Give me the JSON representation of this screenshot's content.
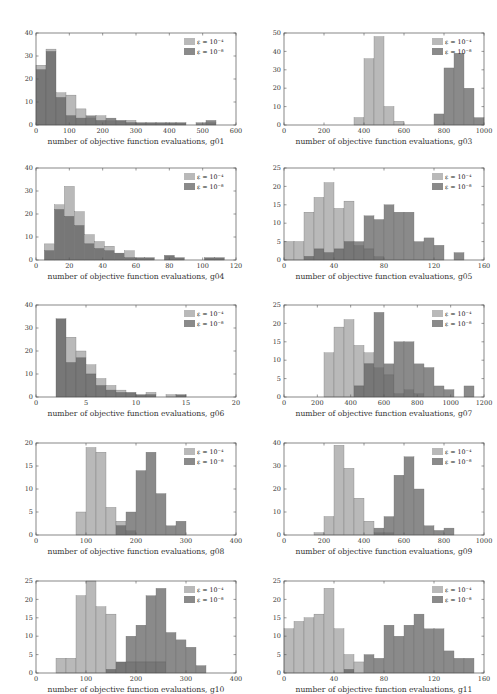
{
  "legend": {
    "light_label": "ε = 10⁻⁴",
    "dark_label": "ε = 10⁻⁸"
  },
  "colors": {
    "light": "#b9b9b9",
    "dark": "#8a8a8a",
    "overlap": "#777777",
    "axis": "#555555"
  },
  "chart_data": [
    {
      "id": "g01",
      "type": "bar",
      "xlabel": "number of objective function evaluations, g01",
      "xlim": [
        0,
        600
      ],
      "xticks": [
        0,
        100,
        200,
        300,
        400,
        500,
        600
      ],
      "ylim": [
        0,
        40
      ],
      "yticks": [
        0,
        10,
        20,
        30,
        40
      ],
      "bin_start": 0,
      "bin_width": 30,
      "series": [
        {
          "name": "ε = 10⁻⁴",
          "values": [
            26,
            33,
            14,
            13,
            7,
            3,
            4,
            2,
            2,
            2,
            1,
            1,
            1,
            1,
            1,
            0,
            0,
            1,
            0,
            0
          ]
        },
        {
          "name": "ε = 10⁻⁸",
          "values": [
            24,
            32,
            12,
            4,
            3,
            4,
            2,
            3,
            2,
            1,
            1,
            1,
            1,
            1,
            1,
            0,
            1,
            2,
            0,
            0
          ]
        }
      ]
    },
    {
      "id": "g03",
      "type": "bar",
      "xlabel": "number of objective function evaluations, g03",
      "xlim": [
        0,
        1000
      ],
      "xticks": [
        0,
        200,
        400,
        600,
        800,
        1000
      ],
      "ylim": [
        0,
        50
      ],
      "yticks": [
        0,
        10,
        20,
        30,
        40,
        50
      ],
      "bin_start": 350,
      "bin_width": 50,
      "series": [
        {
          "name": "ε = 10⁻⁴",
          "values": [
            4,
            36,
            48,
            10,
            2,
            0,
            0,
            0,
            0,
            0,
            0,
            0,
            0
          ]
        },
        {
          "name": "ε = 10⁻⁸",
          "values": [
            0,
            0,
            0,
            0,
            0,
            0,
            0,
            0,
            6,
            31,
            39,
            20,
            4
          ]
        }
      ]
    },
    {
      "id": "g04",
      "type": "bar",
      "xlabel": "number of objective function evaluations, g04",
      "xlim": [
        0,
        120
      ],
      "xticks": [
        0,
        20,
        40,
        60,
        80,
        100,
        120
      ],
      "ylim": [
        0,
        40
      ],
      "yticks": [
        0,
        10,
        20,
        30,
        40
      ],
      "bin_start": 5,
      "bin_width": 6,
      "series": [
        {
          "name": "ε = 10⁻⁴",
          "values": [
            7,
            24,
            32,
            21,
            11,
            8,
            6,
            3,
            4,
            1,
            1,
            0,
            2,
            1,
            0,
            0,
            1,
            1
          ]
        },
        {
          "name": "ε = 10⁻⁸",
          "values": [
            4,
            22,
            19,
            15,
            7,
            5,
            4,
            3,
            1,
            1,
            1,
            0,
            2,
            1,
            0,
            0,
            1,
            1
          ]
        }
      ]
    },
    {
      "id": "g05",
      "type": "bar",
      "xlabel": "number of objective function evaluations, g05",
      "xlim": [
        0,
        160
      ],
      "xticks": [
        0,
        40,
        80,
        120,
        160
      ],
      "ylim": [
        0,
        25
      ],
      "yticks": [
        0,
        5,
        10,
        15,
        20,
        25
      ],
      "bin_start": 0,
      "bin_width": 8,
      "series": [
        {
          "name": "ε = 10⁻⁴",
          "values": [
            5,
            5,
            13,
            17,
            21,
            14,
            16,
            4,
            3,
            1,
            0,
            0,
            0,
            0,
            0,
            0,
            0,
            0,
            0,
            0
          ]
        },
        {
          "name": "ε = 10⁻⁸",
          "values": [
            0,
            0,
            1,
            3,
            2,
            3,
            5,
            5,
            12,
            11,
            15,
            13,
            13,
            5,
            6,
            4,
            0,
            2,
            0,
            0
          ]
        }
      ]
    },
    {
      "id": "g06",
      "type": "bar",
      "xlabel": "number of objective function evaluations, g06",
      "xlim": [
        0,
        20
      ],
      "xticks": [
        0,
        5,
        10,
        15,
        20
      ],
      "ylim": [
        0,
        40
      ],
      "yticks": [
        0,
        10,
        20,
        30,
        40
      ],
      "bin_start": 2,
      "bin_width": 1,
      "series": [
        {
          "name": "ε = 10⁻⁴",
          "values": [
            34,
            26,
            20,
            14,
            8,
            5,
            3,
            2,
            1,
            2,
            0,
            1,
            1
          ]
        },
        {
          "name": "ε = 10⁻⁸",
          "values": [
            34,
            15,
            17,
            10,
            5,
            3,
            2,
            2,
            1,
            1,
            0,
            0,
            1
          ]
        }
      ]
    },
    {
      "id": "g07",
      "type": "bar",
      "xlabel": "number of objective function evaluations, g07",
      "xlim": [
        0,
        1200
      ],
      "xticks": [
        0,
        200,
        400,
        600,
        800,
        1000,
        1200
      ],
      "ylim": [
        0,
        25
      ],
      "yticks": [
        0,
        5,
        10,
        15,
        20,
        25
      ],
      "bin_start": 240,
      "bin_width": 60,
      "series": [
        {
          "name": "ε = 10⁻⁴",
          "values": [
            12,
            19,
            21,
            14,
            12,
            8,
            6,
            1,
            2,
            1,
            0,
            0,
            0,
            0,
            0
          ]
        },
        {
          "name": "ε = 10⁻⁸",
          "values": [
            0,
            0,
            0,
            3,
            9,
            23,
            9,
            15,
            15,
            9,
            8,
            3,
            2,
            0,
            3
          ]
        }
      ]
    },
    {
      "id": "g08",
      "type": "bar",
      "xlabel": "number of objective function evaluations, g08",
      "xlim": [
        0,
        400
      ],
      "xticks": [
        0,
        100,
        200,
        300,
        400
      ],
      "ylim": [
        0,
        20
      ],
      "yticks": [
        0,
        5,
        10,
        15,
        20
      ],
      "bin_start": 80,
      "bin_width": 20,
      "series": [
        {
          "name": "ε = 10⁻⁴",
          "values": [
            5,
            19,
            18,
            6,
            3,
            1,
            0,
            0,
            0,
            0,
            0
          ]
        },
        {
          "name": "ε = 10⁻⁸",
          "values": [
            0,
            0,
            0,
            0,
            2,
            5,
            14,
            18,
            9,
            2,
            3
          ]
        }
      ]
    },
    {
      "id": "g09",
      "type": "bar",
      "xlabel": "number of objective function evaluations, g09",
      "xlim": [
        0,
        1000
      ],
      "xticks": [
        0,
        200,
        400,
        600,
        800,
        1000
      ],
      "ylim": [
        0,
        40
      ],
      "yticks": [
        0,
        10,
        20,
        30,
        40
      ],
      "bin_start": 150,
      "bin_width": 50,
      "series": [
        {
          "name": "ε = 10⁻⁴",
          "values": [
            1,
            8,
            39,
            29,
            16,
            6,
            1,
            1,
            0,
            0,
            0,
            0,
            0,
            0
          ]
        },
        {
          "name": "ε = 10⁻⁸",
          "values": [
            0,
            0,
            0,
            0,
            0,
            0,
            3,
            8,
            26,
            34,
            20,
            4,
            2,
            3
          ]
        }
      ]
    },
    {
      "id": "g10",
      "type": "bar",
      "xlabel": "number of objective function evaluations, g10",
      "xlim": [
        0,
        400
      ],
      "xticks": [
        0,
        100,
        200,
        300,
        400
      ],
      "ylim": [
        0,
        25
      ],
      "yticks": [
        0,
        5,
        10,
        15,
        20,
        25
      ],
      "bin_start": 40,
      "bin_width": 20,
      "series": [
        {
          "name": "ε = 10⁻⁴",
          "values": [
            4,
            4,
            21,
            25,
            18,
            16,
            3,
            3,
            3,
            3,
            3,
            0,
            0,
            0,
            0
          ]
        },
        {
          "name": "ε = 10⁻⁸",
          "values": [
            0,
            0,
            0,
            0,
            0,
            1,
            3,
            10,
            13,
            21,
            23,
            11,
            9,
            7,
            2
          ]
        }
      ]
    },
    {
      "id": "g11",
      "type": "bar",
      "xlabel": "number of objective function evaluations, g11",
      "xlim": [
        0,
        160
      ],
      "xticks": [
        0,
        40,
        80,
        120,
        160
      ],
      "ylim": [
        0,
        25
      ],
      "yticks": [
        0,
        5,
        10,
        15,
        20,
        25
      ],
      "bin_start": 0,
      "bin_width": 8,
      "series": [
        {
          "name": "ε = 10⁻⁴",
          "values": [
            12,
            14,
            15,
            16,
            23,
            12,
            5,
            3,
            0,
            0,
            0,
            0,
            0,
            0,
            0,
            0,
            0,
            0,
            0
          ]
        },
        {
          "name": "ε = 10⁻⁸",
          "values": [
            0,
            0,
            0,
            0,
            0,
            0,
            1,
            0,
            5,
            4,
            13,
            10,
            13,
            16,
            12,
            12,
            6,
            4,
            4
          ]
        }
      ]
    }
  ]
}
